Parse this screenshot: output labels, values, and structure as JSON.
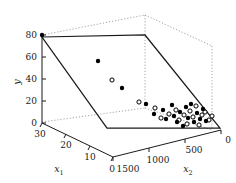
{
  "figure": {
    "title": "",
    "background_color": "#ffffff",
    "foreground_color": "#000000"
  },
  "axes": {
    "y": {
      "label": "y",
      "ticks": [
        "0",
        "20",
        "40",
        "60",
        "80"
      ],
      "range": [
        0,
        80
      ]
    },
    "x1": {
      "label": "x",
      "label_sub": "1",
      "ticks": [
        "30",
        "20",
        "10",
        "0"
      ],
      "range": [
        0,
        30
      ],
      "reversed": true
    },
    "x2": {
      "label": "x",
      "label_sub": "2",
      "ticks": [
        "1500",
        "1000",
        "500",
        "0"
      ],
      "range": [
        0,
        1500
      ],
      "reversed": true
    }
  },
  "legend": {
    "visible": false,
    "entries": [
      {
        "marker": "filled-circle",
        "label": "observed"
      },
      {
        "marker": "open-circle",
        "label": "fitted"
      }
    ]
  },
  "chart_data": {
    "type": "scatter",
    "title": "",
    "xlabel": "x1",
    "ylabel": "y",
    "zlabel": "x2",
    "projection": "3d",
    "grid": false,
    "legend_position": "none",
    "axis_ranges": {
      "x1": [
        0,
        30
      ],
      "x2": [
        0,
        1500
      ],
      "y": [
        0,
        80
      ]
    },
    "axis_ticks": {
      "y": [
        0,
        20,
        40,
        60,
        80
      ],
      "x1": [
        30,
        20,
        10,
        0
      ],
      "x2": [
        1500,
        1000,
        500,
        0
      ]
    },
    "surface": {
      "kind": "fitted-plane",
      "corners_px": [
        [
          42,
          37
        ],
        [
          145,
          35
        ],
        [
          220,
          128
        ],
        [
          107,
          128
        ]
      ]
    },
    "series": [
      {
        "name": "observed",
        "marker": "filled-circle",
        "color": "#000000",
        "points_px": [
          [
            42,
            35
          ],
          [
            98,
            61
          ],
          [
            122,
            88
          ],
          [
            146,
            104
          ],
          [
            154,
            114
          ],
          [
            163,
            110
          ],
          [
            166,
            119
          ],
          [
            172,
            105
          ],
          [
            174,
            116
          ],
          [
            177,
            122
          ],
          [
            180,
            112
          ],
          [
            183,
            126
          ],
          [
            186,
            107
          ],
          [
            188,
            118
          ],
          [
            191,
            104
          ],
          [
            194,
            122
          ],
          [
            197,
            113
          ],
          [
            200,
            119
          ],
          [
            203,
            109
          ],
          [
            206,
            121
          ]
        ]
      },
      {
        "name": "fitted",
        "marker": "open-circle",
        "color": "#000000",
        "points_px": [
          [
            112,
            80
          ],
          [
            139,
            102
          ],
          [
            155,
            108
          ],
          [
            161,
            118
          ],
          [
            169,
            114
          ],
          [
            176,
            110
          ],
          [
            179,
            120
          ],
          [
            184,
            115
          ],
          [
            187,
            124
          ],
          [
            190,
            111
          ],
          [
            193,
            117
          ],
          [
            196,
            106
          ],
          [
            199,
            125
          ],
          [
            202,
            115
          ],
          [
            205,
            112
          ],
          [
            209,
            120
          ],
          [
            212,
            116
          ]
        ]
      }
    ]
  }
}
